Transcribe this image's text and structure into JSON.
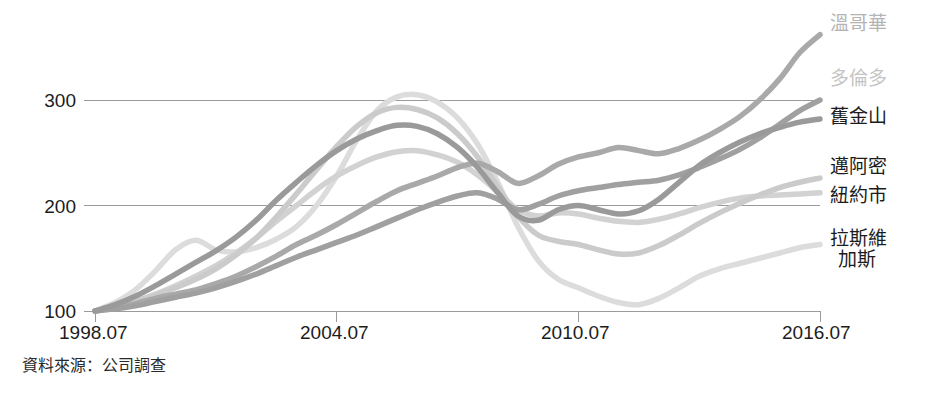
{
  "chart_data": {
    "type": "line",
    "title": "",
    "xlabel": "",
    "ylabel": "",
    "xlim": [
      1998.54,
      2016.54
    ],
    "ylim": [
      88,
      372
    ],
    "grid": true,
    "gridlines": [
      100,
      200,
      300
    ],
    "legend_position": "right",
    "x_tick_labels": [
      "1998.07",
      "2004.07",
      "2010.07",
      "2016.07"
    ],
    "x_ticks": [
      1998.54,
      2004.54,
      2010.54,
      2016.54
    ],
    "y_tick_labels": [
      "100",
      "200",
      "300"
    ],
    "y_ticks": [
      100,
      200,
      300
    ],
    "x": [
      1998.54,
      1999.04,
      1999.54,
      2000.04,
      2000.54,
      2001.04,
      2001.54,
      2002.04,
      2002.54,
      2003.04,
      2003.54,
      2004.04,
      2004.54,
      2005.04,
      2005.54,
      2006.04,
      2006.54,
      2007.04,
      2007.54,
      2008.04,
      2008.54,
      2009.04,
      2009.54,
      2010.04,
      2010.54,
      2011.04,
      2011.54,
      2012.04,
      2012.54,
      2013.04,
      2013.54,
      2014.04,
      2014.54,
      2015.04,
      2015.54,
      2016.04,
      2016.54
    ],
    "series": [
      {
        "name": "溫哥華",
        "name_en": "Vancouver",
        "color": "#a9a9a9",
        "values": [
          100,
          103,
          107,
          112,
          116,
          120,
          126,
          133,
          142,
          152,
          163,
          172,
          182,
          193,
          204,
          214,
          221,
          228,
          236,
          240,
          232,
          221,
          228,
          239,
          246,
          250,
          255,
          252,
          249,
          254,
          262,
          272,
          284,
          300,
          320,
          345,
          362
        ]
      },
      {
        "name": "多倫多",
        "name_en": "Toronto",
        "color": "#a0a0a0",
        "values": [
          100,
          102,
          105,
          109,
          113,
          117,
          122,
          128,
          135,
          143,
          151,
          158,
          165,
          172,
          180,
          188,
          196,
          203,
          209,
          212,
          206,
          196,
          201,
          209,
          214,
          217,
          220,
          222,
          224,
          229,
          236,
          244,
          253,
          264,
          277,
          290,
          300
        ]
      },
      {
        "name": "舊金山",
        "name_en": "San Francisco",
        "color": "#9a9a9a",
        "values": [
          100,
          106,
          114,
          124,
          135,
          146,
          157,
          170,
          186,
          205,
          222,
          238,
          252,
          263,
          271,
          276,
          275,
          268,
          255,
          236,
          212,
          190,
          186,
          196,
          200,
          196,
          192,
          195,
          206,
          222,
          238,
          250,
          260,
          268,
          274,
          279,
          282
        ]
      },
      {
        "name": "邁阿密",
        "name_en": "Miami",
        "color": "#cbcbcb",
        "values": [
          100,
          104,
          109,
          115,
          122,
          130,
          140,
          153,
          169,
          189,
          211,
          234,
          256,
          275,
          288,
          293,
          291,
          283,
          268,
          246,
          218,
          190,
          172,
          166,
          163,
          158,
          154,
          155,
          162,
          172,
          183,
          193,
          202,
          210,
          217,
          222,
          226
        ]
      },
      {
        "name": "紐約市",
        "name_en": "New York City",
        "color": "#d2d2d2",
        "values": [
          100,
          104,
          109,
          116,
          124,
          133,
          143,
          155,
          169,
          185,
          200,
          215,
          228,
          238,
          246,
          251,
          252,
          248,
          241,
          229,
          213,
          196,
          190,
          193,
          192,
          188,
          185,
          184,
          187,
          192,
          198,
          203,
          207,
          209,
          210,
          211,
          212
        ]
      },
      {
        "name": "拉斯維加斯",
        "name_en": "Las Vegas",
        "color": "#dcdcdc",
        "values": [
          100,
          108,
          120,
          138,
          158,
          167,
          158,
          156,
          160,
          168,
          180,
          200,
          228,
          262,
          290,
          303,
          305,
          298,
          283,
          258,
          222,
          180,
          148,
          130,
          122,
          114,
          108,
          106,
          112,
          122,
          133,
          140,
          145,
          150,
          155,
          160,
          163
        ]
      }
    ],
    "legend_entries": [
      {
        "label": "溫哥華",
        "color": "#b4b4b4",
        "lines": [
          "溫哥華"
        ]
      },
      {
        "label": "多倫多",
        "color": "#c4c4c4",
        "lines": [
          "多倫多"
        ]
      },
      {
        "label": "舊金山",
        "color": "#1c1c1c",
        "lines": [
          "舊金山"
        ]
      },
      {
        "label": "邁阿密",
        "color": "#1c1c1c",
        "lines": [
          "邁阿密"
        ]
      },
      {
        "label": "紐約市",
        "color": "#1c1c1c",
        "lines": [
          "紐約市"
        ]
      },
      {
        "label": "拉斯維加斯",
        "color": "#1c1c1c",
        "lines": [
          "拉斯維",
          "加斯"
        ]
      }
    ]
  },
  "source_note": "資料來源：公司調查",
  "axis": {
    "y_labels": [
      "300",
      "200",
      "100"
    ],
    "x_labels": [
      "1998.07",
      "2004.07",
      "2010.07",
      "2016.07"
    ]
  },
  "legend": {
    "vancouver": "溫哥華",
    "toronto": "多倫多",
    "san_francisco": "舊金山",
    "miami": "邁阿密",
    "new_york": "紐約市",
    "las_vegas_line1": "拉斯維",
    "las_vegas_line2": "加斯"
  },
  "colors": {
    "gridline": "#9b9b9b",
    "text": "#1c1c1c",
    "legend_muted_1": "#b4b4b4",
    "legend_muted_2": "#c4c4c4"
  }
}
